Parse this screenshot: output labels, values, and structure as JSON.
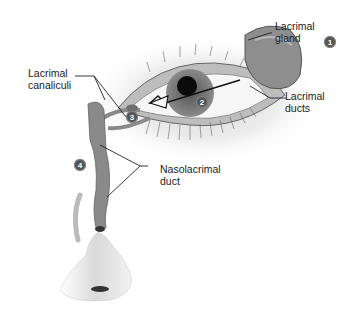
{
  "diagram": {
    "labels": {
      "lacrimal_gland": "Lacrimal\ngland",
      "lacrimal_ducts": "Lacrimal\nducts",
      "lacrimal_canaliculi": "Lacrimal\ncanaliculi",
      "nasolacrimal_duct": "Nasolacrimal\nduct"
    },
    "steps": [
      "1",
      "2",
      "3",
      "4"
    ],
    "colors": {
      "duct_fill": "#8a8a8a",
      "badge": "#555555",
      "outline": "#222222"
    }
  }
}
